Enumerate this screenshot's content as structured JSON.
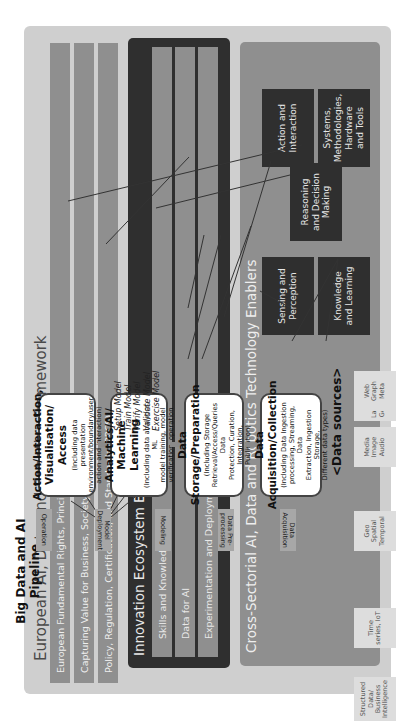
{
  "framework": {
    "title": "European AI, Data and Robotics Framework",
    "bands": [
      "European Fundamental Rights, Principles, and Values",
      "Capturing Value for Business, Society, and People",
      "Policy, Regulation, Certification, and Standards (PRCS)"
    ]
  },
  "innovation_ecosystem": {
    "title": "Innovation Ecosystem Enabler",
    "bands": [
      "Skills and Knowledge",
      "Data for AI",
      "Experimentation and Deployment"
    ]
  },
  "technology_enablers": {
    "title": "Cross-Sectorial AI, Data and Robotics Technology Enablers",
    "boxes": [
      "Sensing and\nPerception",
      "Knowledge\nand Learning",
      "Reasoning\nand Decision\nMaking",
      "Action and\nInteraction",
      "Systems,\nMethodologies,\nHardware\nand Tools"
    ]
  },
  "pipeline": {
    "title": "Big Data and AI\nPipeline",
    "steps": [
      {
        "title": "Action/Interaction,\nVisualisation/ Access",
        "sub": "(Including data presentation\nenvironment/boundary/user\naction and interaction)"
      },
      {
        "title": "Analytics/AI/\nMachine Learning",
        "sub": "(Including data analytics, ML\nmodel training, model\nverification, operation"
      },
      {
        "title": "Data\nStorage/Preparation",
        "sub": "(Including Storage\nRetrieval/Access/Queries Data\nProtection, Curation, Integration,\nPublication)"
      },
      {
        "title": "Data\nAcquisition/Collection",
        "sub": "(Including Data Ingestion\nprocessing, Streaming, Data\nExtraction, Ingestion Storage,\nDifferent data types)"
      }
    ],
    "ml_steps": [
      "Setup Model",
      "Train Model",
      "Verify Model",
      "Validate Model",
      "Exercise Model"
    ],
    "stage_tags": [
      "Operation",
      "Model\nDeployment",
      "Modeling",
      "Data Pre-\nprocessing",
      "Data\nAcquisition"
    ]
  },
  "data_sources": {
    "title": "<Data sources>",
    "items": [
      "Structured\nData/\nBusiness\nIntelligence",
      "Time\nseries, IoT",
      "Geo\nSpatial\nTemporal",
      "Media\nImage\nAudio",
      "Text,\nLanguage,\nGenomics",
      "Web\nGraph\nMeta"
    ]
  }
}
